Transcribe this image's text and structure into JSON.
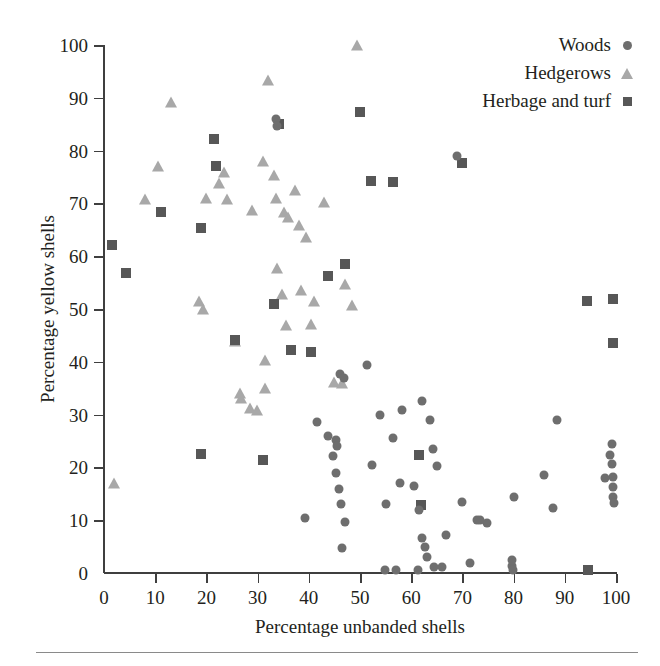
{
  "chart_data": {
    "type": "scatter",
    "title": "",
    "xlabel": "Percentage unbanded shells",
    "ylabel": "Percentage yellow shells",
    "xlim": [
      0,
      100
    ],
    "ylim": [
      0,
      100
    ],
    "xticks": [
      0,
      10,
      20,
      30,
      40,
      50,
      60,
      70,
      80,
      90,
      100
    ],
    "yticks": [
      0,
      10,
      20,
      30,
      40,
      50,
      60,
      70,
      80,
      90,
      100
    ],
    "grid": false,
    "legend_position": "top-right",
    "colors": {
      "woods": "#6e6e6e",
      "hedgerows": "#a8a8a8",
      "herbage_and_turf": "#575757",
      "axis": "#3f3f3f",
      "text": "#231f20",
      "background": "#ffffff"
    },
    "series": [
      {
        "name": "Woods",
        "marker": "circle",
        "color": "#6e6e6e",
        "points": [
          [
            33.6,
            85.9
          ],
          [
            33.8,
            84.6
          ],
          [
            46.1,
            37.7
          ],
          [
            46.9,
            37.0
          ],
          [
            51.3,
            39.4
          ],
          [
            69.0,
            78.9
          ],
          [
            41.6,
            28.6
          ],
          [
            43.7,
            25.9
          ],
          [
            45.4,
            25.2
          ],
          [
            45.6,
            24.1
          ],
          [
            54.0,
            29.9
          ],
          [
            56.5,
            25.6
          ],
          [
            58.2,
            30.9
          ],
          [
            62.2,
            32.6
          ],
          [
            63.6,
            28.9
          ],
          [
            64.2,
            23.5
          ],
          [
            65.0,
            20.2
          ],
          [
            39.3,
            10.4
          ],
          [
            44.8,
            22.2
          ],
          [
            45.3,
            18.9
          ],
          [
            45.9,
            16.0
          ],
          [
            46.2,
            13.0
          ],
          [
            47.0,
            9.6
          ],
          [
            46.4,
            4.7
          ],
          [
            52.4,
            20.4
          ],
          [
            55.1,
            13.0
          ],
          [
            57.8,
            17.1
          ],
          [
            60.5,
            16.4
          ],
          [
            61.5,
            12.0
          ],
          [
            62.2,
            6.6
          ],
          [
            62.6,
            4.9
          ],
          [
            63.0,
            3.1
          ],
          [
            64.5,
            1.1
          ],
          [
            66.0,
            1.2
          ],
          [
            54.8,
            0.6
          ],
          [
            57.0,
            0.6
          ],
          [
            61.4,
            0.5
          ],
          [
            66.8,
            7.2
          ],
          [
            70.0,
            13.5
          ],
          [
            71.4,
            1.9
          ],
          [
            72.8,
            10.1
          ],
          [
            73.5,
            10.0
          ],
          [
            74.9,
            9.4
          ],
          [
            79.7,
            1.3
          ],
          [
            79.6,
            2.5
          ],
          [
            79.9,
            0.6
          ],
          [
            80.0,
            14.3
          ],
          [
            86.0,
            18.6
          ],
          [
            87.6,
            12.3
          ],
          [
            88.5,
            28.9
          ],
          [
            98.9,
            22.4
          ],
          [
            99.2,
            24.4
          ],
          [
            99.3,
            20.6
          ],
          [
            99.4,
            18.1
          ],
          [
            99.5,
            16.3
          ],
          [
            99.5,
            14.3
          ],
          [
            99.6,
            13.2
          ],
          [
            97.8,
            17.9
          ]
        ]
      },
      {
        "name": "Hedgerows",
        "marker": "triangle",
        "color": "#a8a8a8",
        "points": [
          [
            2.0,
            17.0
          ],
          [
            8.0,
            70.9
          ],
          [
            10.5,
            77.0
          ],
          [
            13.0,
            89.2
          ],
          [
            18.5,
            51.5
          ],
          [
            19.3,
            50.0
          ],
          [
            20.0,
            71.0
          ],
          [
            22.5,
            73.8
          ],
          [
            23.4,
            76.0
          ],
          [
            24.0,
            70.8
          ],
          [
            25.5,
            44.0
          ],
          [
            26.8,
            33.1
          ],
          [
            28.5,
            31.3
          ],
          [
            29.8,
            30.9
          ],
          [
            31.0,
            78.0
          ],
          [
            31.5,
            40.3
          ],
          [
            32.0,
            93.4
          ],
          [
            33.2,
            75.4
          ],
          [
            33.6,
            71.0
          ],
          [
            33.8,
            57.8
          ],
          [
            34.8,
            52.8
          ],
          [
            35.2,
            68.3
          ],
          [
            36.0,
            67.5
          ],
          [
            37.4,
            72.6
          ],
          [
            38.0,
            66.0
          ],
          [
            38.5,
            53.6
          ],
          [
            39.4,
            63.7
          ],
          [
            40.5,
            47.2
          ],
          [
            41.0,
            51.5
          ],
          [
            43.0,
            70.3
          ],
          [
            45.0,
            36.2
          ],
          [
            46.5,
            36.0
          ],
          [
            47.0,
            54.8
          ],
          [
            48.5,
            50.7
          ],
          [
            49.5,
            100.0
          ],
          [
            29.0,
            68.7
          ],
          [
            35.5,
            46.9
          ],
          [
            31.5,
            35.0
          ],
          [
            26.5,
            34.0
          ]
        ]
      },
      {
        "name": "Herbage and turf",
        "marker": "square",
        "color": "#575757",
        "points": [
          [
            1.5,
            62.2
          ],
          [
            4.2,
            56.9
          ],
          [
            11.2,
            68.3
          ],
          [
            19.0,
            65.3
          ],
          [
            18.9,
            22.5
          ],
          [
            21.5,
            82.2
          ],
          [
            21.8,
            77.0
          ],
          [
            25.5,
            44.1
          ],
          [
            31.0,
            21.4
          ],
          [
            33.3,
            51.0
          ],
          [
            34.2,
            85.0
          ],
          [
            36.5,
            42.3
          ],
          [
            40.5,
            41.9
          ],
          [
            43.8,
            56.3
          ],
          [
            47.0,
            58.5
          ],
          [
            50.0,
            87.3
          ],
          [
            52.2,
            74.2
          ],
          [
            56.5,
            74.0
          ],
          [
            61.5,
            22.4
          ],
          [
            62.0,
            12.9
          ],
          [
            70.0,
            77.6
          ],
          [
            94.5,
            0.6
          ],
          [
            94.3,
            51.5
          ],
          [
            99.5,
            51.8
          ],
          [
            99.4,
            43.5
          ]
        ]
      }
    ]
  },
  "legend": {
    "items": [
      {
        "label": "Woods",
        "marker": "circle-marker"
      },
      {
        "label": "Hedgerows",
        "marker": "triangle-marker"
      },
      {
        "label": "Herbage and turf",
        "marker": "square-marker"
      }
    ]
  }
}
